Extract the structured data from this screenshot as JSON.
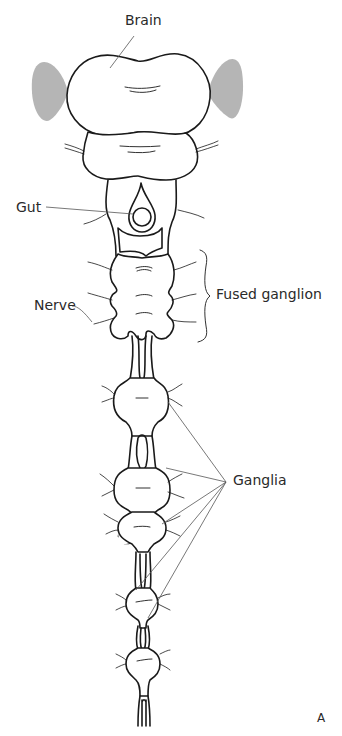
{
  "diagram": {
    "type": "anatomical diagram",
    "panel_label": "A",
    "labels": {
      "brain": "Brain",
      "gut": "Gut",
      "nerve": "Nerve",
      "fused_ganglion": "Fused ganglion",
      "ganglia": "Ganglia"
    },
    "colors": {
      "stroke": "#1a1a1a",
      "leader_line": "#555555",
      "optic_lobe_fill": "#b5b5b5",
      "background": "#ffffff"
    },
    "ganglia_count": 5
  }
}
